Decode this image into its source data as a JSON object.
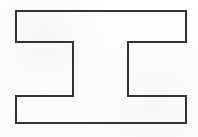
{
  "image": {
    "title": "H-shape outline drawing",
    "width": 198,
    "height": 137,
    "background_color": "#fefefe",
    "description": "Black line-drawing outline of a single closed 12-sided polygon resembling a capital letter H rotated 90 degrees (an I-beam lying on its side)."
  },
  "shape": {
    "name": "rotated-h-polygon",
    "kind": "closed-polygon",
    "vertex_count": 12,
    "stroke_color": "#333333",
    "stroke_width": 2,
    "fill_color": "none",
    "points": "16,11 186,11 186,42 128,42 128,96 186,96 186,123 16,123 16,96 73,96 73,42 16,42",
    "vertices": [
      {
        "x": 16,
        "y": 11,
        "label": "top-left-outer"
      },
      {
        "x": 186,
        "y": 11,
        "label": "top-right-outer"
      },
      {
        "x": 186,
        "y": 42,
        "label": "right-upper-arm-inner"
      },
      {
        "x": 128,
        "y": 42,
        "label": "right-notch-top"
      },
      {
        "x": 128,
        "y": 96,
        "label": "right-notch-bottom"
      },
      {
        "x": 186,
        "y": 96,
        "label": "right-lower-arm-inner"
      },
      {
        "x": 186,
        "y": 123,
        "label": "bottom-right-outer"
      },
      {
        "x": 16,
        "y": 123,
        "label": "bottom-left-outer"
      },
      {
        "x": 16,
        "y": 96,
        "label": "left-lower-arm-inner"
      },
      {
        "x": 73,
        "y": 96,
        "label": "left-notch-bottom"
      },
      {
        "x": 73,
        "y": 42,
        "label": "left-notch-top"
      },
      {
        "x": 16,
        "y": 42,
        "label": "left-upper-arm-inner"
      }
    ],
    "bounds": {
      "left": 16,
      "top": 11,
      "right": 186,
      "bottom": 123,
      "width": 170,
      "height": 112
    },
    "notches": [
      {
        "name": "left-notch",
        "x": 16,
        "y": 42,
        "width": 57,
        "height": 54,
        "opens": "left"
      },
      {
        "name": "right-notch",
        "x": 128,
        "y": 42,
        "width": 58,
        "height": 54,
        "opens": "right"
      }
    ],
    "bar": {
      "name": "center-bar",
      "x": 73,
      "y": 42,
      "width": 55,
      "height": 54
    }
  }
}
